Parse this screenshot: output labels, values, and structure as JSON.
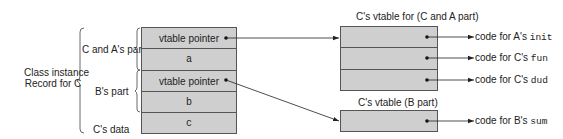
{
  "record": {
    "outer_label_line1": "Class instance",
    "outer_label_line2": "Record for C",
    "part_labels": {
      "c_and_a": "C and A's part",
      "b": "B's part",
      "c_data": "C's data"
    },
    "cells": [
      {
        "text": "vtable pointer"
      },
      {
        "text": "a"
      },
      {
        "text": "vtable pointer"
      },
      {
        "text": "b"
      },
      {
        "text": "c"
      }
    ]
  },
  "vtable_ca": {
    "title": "C's vtable for (C and A part)",
    "targets": [
      {
        "prefix": "code for A's ",
        "method": "init"
      },
      {
        "prefix": "code for C's ",
        "method": "fun"
      },
      {
        "prefix": "code for C's ",
        "method": "dud"
      }
    ]
  },
  "vtable_b": {
    "title": "C's vtable (B part)",
    "targets": [
      {
        "prefix": "code for B's ",
        "method": "sum"
      }
    ]
  },
  "colors": {
    "cell_fill": "#cfcfcf",
    "border": "#555555",
    "line": "#222222"
  }
}
